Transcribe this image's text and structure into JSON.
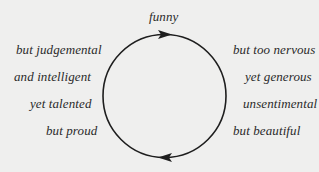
{
  "diagram": {
    "type": "cycle",
    "top_label": "funny",
    "left_labels": [
      "but judgemental",
      "and intelligent",
      "yet talented",
      "but proud"
    ],
    "right_labels": [
      "but too nervous",
      "yet generous",
      "unsentimental",
      "but beautiful"
    ],
    "arrows": [
      {
        "position": "top",
        "direction": "right"
      },
      {
        "position": "bottom",
        "direction": "left"
      }
    ],
    "colors": {
      "background": "#efefee",
      "text": "#2a2a2a",
      "stroke": "#1e1e1e"
    }
  }
}
